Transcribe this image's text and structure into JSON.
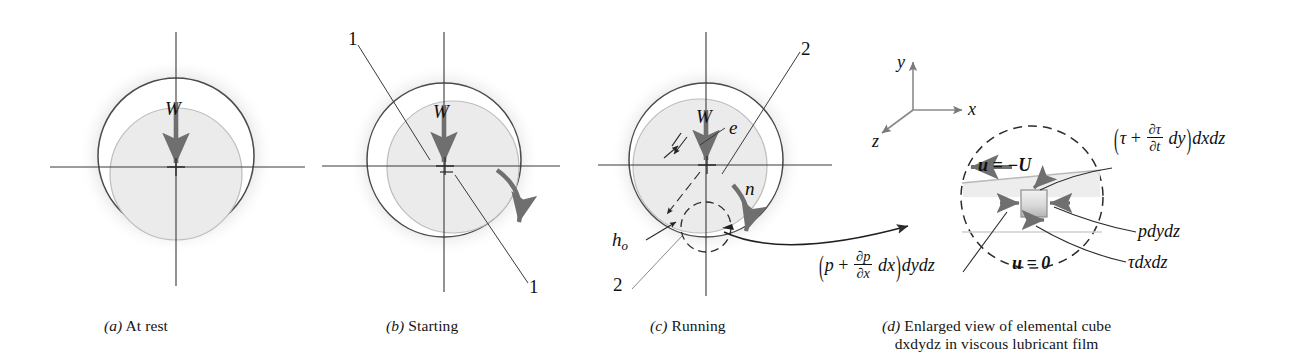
{
  "figure": {
    "stroke": "#2b2b2b",
    "journal_fill": "#e9e9e9",
    "bushing_fill": "#ffffff",
    "arrow_gray": "#777777",
    "shadow": "#9a9a9a"
  },
  "captions": [
    {
      "tag": "(a)",
      "text": "At rest",
      "line2": ""
    },
    {
      "tag": "(b)",
      "text": "Starting",
      "line2": ""
    },
    {
      "tag": "(c)",
      "text": "Running",
      "line2": ""
    },
    {
      "tag": "(d)",
      "text": "Enlarged view of elemental cube",
      "line2": "dxdydz in viscous lubricant film"
    }
  ],
  "panel_a": {
    "load_label": "W"
  },
  "panel_b": {
    "load_label": "W",
    "callout_top": "1",
    "callout_bottom": "1"
  },
  "panel_c": {
    "load_label": "W",
    "eccentricity_label": "e",
    "speed_label": "n",
    "film_thickness_label": "h",
    "film_thickness_sub": "o",
    "callout_top": "2",
    "callout_bottom": "2"
  },
  "panel_d": {
    "axes": {
      "y": "y",
      "x": "x",
      "z": "z"
    },
    "velocity_top": "u = −U",
    "velocity_bottom": "u = 0",
    "shear_top": {
      "open": "(",
      "tau": "τ",
      "plus": "+",
      "num": "∂τ",
      "den": "∂t",
      "dy": "dy",
      "close": ")",
      "tail": "dxdz"
    },
    "pressure_left": {
      "open": "(",
      "p": "p",
      "plus": "+",
      "num": "∂p",
      "den": "∂x",
      "dx": "dx",
      "close": ")",
      "tail": "dydz"
    },
    "pressure_right": "pdydz",
    "shear_bottom": "τdxdz"
  }
}
